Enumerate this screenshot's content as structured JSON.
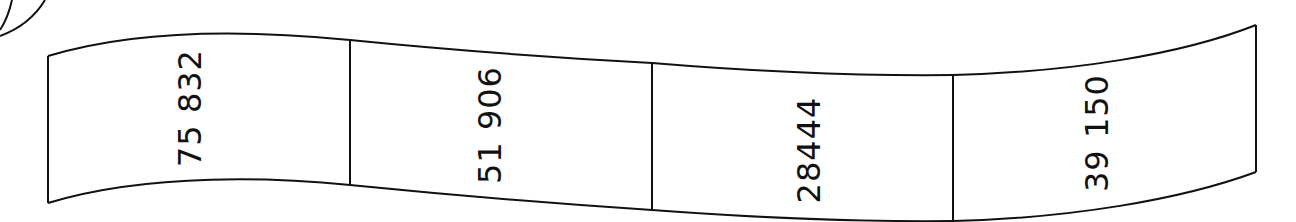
{
  "banner": {
    "cells": [
      {
        "label": "75 832",
        "cx": 190,
        "cy": 108
      },
      {
        "label": "51 906",
        "cx": 490,
        "cy": 125
      },
      {
        "label": "28444",
        "cx": 809,
        "cy": 150
      },
      {
        "label": "39 150",
        "cx": 1097,
        "cy": 133
      }
    ],
    "stroke_color": "#111111",
    "background_color": "#ffffff"
  }
}
